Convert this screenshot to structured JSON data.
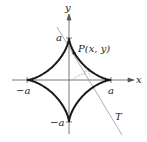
{
  "figure": {
    "curve": "astroid x^(2/3) + y^(2/3) = a^(2/3)",
    "colors": {
      "curve": "#1a1a1a",
      "axes": "#555555",
      "tangent": "#999999",
      "text": "#222222"
    }
  },
  "labels": {
    "x_axis": "x",
    "y_axis": "y",
    "a_right": "a",
    "a_left": "−a",
    "a_top": "a",
    "a_bottom": "−a",
    "point": "P(x, y)",
    "tangent": "T"
  }
}
